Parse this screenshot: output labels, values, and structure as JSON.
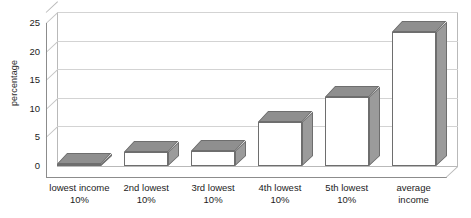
{
  "chart_data": {
    "type": "bar",
    "title": "",
    "xlabel": "",
    "ylabel": "percentage",
    "categories": [
      "lowest income 10%",
      "2nd lowest 10%",
      "3rd lowest 10%",
      "4th lowest 10%",
      "5th lowest 10%",
      "average income"
    ],
    "category_lines": [
      [
        "lowest income",
        "10%"
      ],
      [
        "2nd lowest",
        "10%"
      ],
      [
        "3rd lowest",
        "10%"
      ],
      [
        "4th lowest",
        "10%"
      ],
      [
        "5th lowest",
        "10%"
      ],
      [
        "average",
        "income"
      ]
    ],
    "values": [
      0.3,
      2.5,
      2.7,
      7.7,
      12.0,
      23.5
    ],
    "ylim": [
      0,
      25
    ],
    "yticks": [
      0,
      5,
      10,
      15,
      20,
      25
    ],
    "ytick_labels": [
      "0",
      "5",
      "10",
      "15",
      "20",
      "25"
    ],
    "grid": true,
    "legend": false,
    "style": "3d-bar",
    "colors": {
      "bar_front": "#ffffff",
      "bar_top": "#8f8f8f",
      "bar_side": "#9b9b9b",
      "bar_outline": "#6e6e6e",
      "gridline": "#d3d3d3",
      "axis": "#8c8c8c",
      "plot_border": "#b9b9b9",
      "text": "#1c1c1c",
      "background": "#ffffff"
    }
  }
}
